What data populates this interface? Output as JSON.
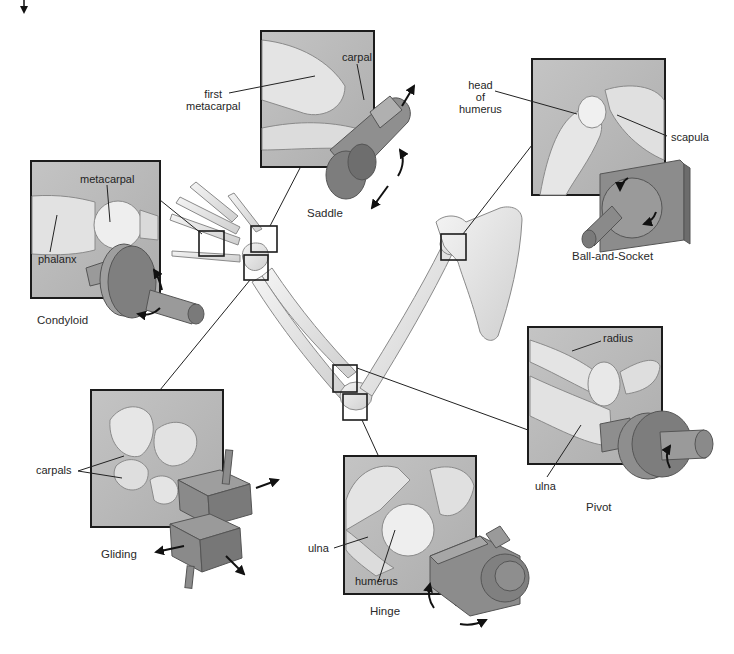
{
  "colors": {
    "panel_bg": "#b9b9b9",
    "panel_border": "#1c1c1c",
    "bone_fill": "#e3e3e3",
    "bone_stroke": "#8a8a8a",
    "model_fill": "#8d8d8d",
    "model_dark": "#6f6f6f",
    "leader_line": "#222222"
  },
  "joints": [
    {
      "id": "saddle",
      "caption": "Saddle",
      "labels": [
        {
          "text_lines": [
            "first",
            "metacarpal"
          ]
        },
        {
          "text_lines": [
            "carpal"
          ]
        }
      ]
    },
    {
      "id": "ball-and-socket",
      "caption": "Ball-and-Socket",
      "labels": [
        {
          "text_lines": [
            "head",
            "of",
            "humerus"
          ]
        },
        {
          "text_lines": [
            "scapula"
          ]
        }
      ]
    },
    {
      "id": "condyloid",
      "caption": "Condyloid",
      "labels": [
        {
          "text_lines": [
            "metacarpal"
          ]
        },
        {
          "text_lines": [
            "phalanx"
          ]
        }
      ]
    },
    {
      "id": "gliding",
      "caption": "Gliding",
      "labels": [
        {
          "text_lines": [
            "carpals"
          ]
        }
      ]
    },
    {
      "id": "hinge",
      "caption": "Hinge",
      "labels": [
        {
          "text_lines": [
            "ulna"
          ]
        },
        {
          "text_lines": [
            "humerus"
          ]
        }
      ]
    },
    {
      "id": "pivot",
      "caption": "Pivot",
      "labels": [
        {
          "text_lines": [
            "radius"
          ]
        },
        {
          "text_lines": [
            "ulna"
          ]
        }
      ]
    }
  ]
}
